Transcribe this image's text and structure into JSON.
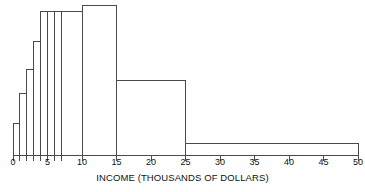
{
  "chart_data": {
    "type": "bar",
    "title": "",
    "subtitle": "",
    "xlabel": "INCOME (THOUSANDS OF DOLLARS)",
    "ylabel": "",
    "grid": false,
    "legend": null,
    "xlim": [
      0,
      50
    ],
    "ylim": [
      0,
      1.0
    ],
    "x_ticks": [
      0,
      1,
      2,
      3,
      4,
      5,
      6,
      7,
      10,
      15,
      20,
      25,
      30,
      35,
      40,
      45,
      50
    ],
    "x_tick_labels": [
      {
        "value": 0,
        "label": "0"
      },
      {
        "value": 5,
        "label": "5"
      },
      {
        "value": 10,
        "label": "10"
      },
      {
        "value": 15,
        "label": "15"
      },
      {
        "value": 20,
        "label": "20"
      },
      {
        "value": 25,
        "label": "25"
      },
      {
        "value": 30,
        "label": "30"
      },
      {
        "value": 35,
        "label": "35"
      },
      {
        "value": 40,
        "label": "40"
      },
      {
        "value": 45,
        "label": "45"
      },
      {
        "value": 50,
        "label": "50"
      }
    ],
    "minor_tick_values": [
      1,
      2,
      3,
      4,
      6,
      7
    ],
    "bin_edges": [
      0,
      1,
      2,
      3,
      4,
      5,
      6,
      7,
      10,
      15,
      25,
      50
    ],
    "bins": [
      {
        "x0": 0,
        "x1": 1,
        "density": 0.21
      },
      {
        "x0": 1,
        "x1": 2,
        "density": 0.41
      },
      {
        "x0": 2,
        "x1": 3,
        "density": 0.57
      },
      {
        "x0": 3,
        "x1": 4,
        "density": 0.76
      },
      {
        "x0": 4,
        "x1": 5,
        "density": 0.96
      },
      {
        "x0": 5,
        "x1": 6,
        "density": 0.96
      },
      {
        "x0": 6,
        "x1": 7,
        "density": 0.96
      },
      {
        "x0": 7,
        "x1": 10,
        "density": 0.96
      },
      {
        "x0": 10,
        "x1": 15,
        "density": 1.0
      },
      {
        "x0": 15,
        "x1": 25,
        "density": 0.5
      },
      {
        "x0": 25,
        "x1": 50,
        "density": 0.08
      }
    ],
    "colors": {
      "bar_fill": "#ffffff",
      "bar_stroke": "#4a4a4a",
      "axis": "#4a4a4a",
      "text": "#111111",
      "background": "#ffffff"
    }
  },
  "layout": {
    "plot_left": 13,
    "plot_right": 358,
    "baseline_y": 155,
    "plot_top": 5,
    "tick_length": 6,
    "tick_label_y": 157
  }
}
